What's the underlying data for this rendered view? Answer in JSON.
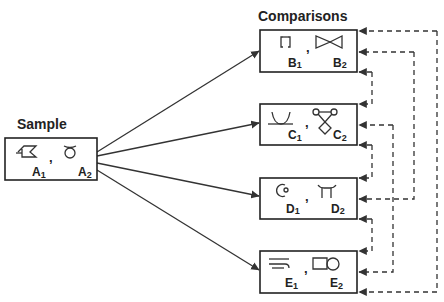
{
  "diagram": {
    "sample": {
      "heading": "Sample",
      "items": [
        {
          "letter": "A",
          "index": "1",
          "glyph": "flag-stroke-icon"
        },
        {
          "letter": "A",
          "index": "2",
          "glyph": "ring-loop-icon"
        }
      ],
      "separator": ","
    },
    "comparisons": {
      "heading": "Comparisons",
      "groups": [
        {
          "id": "B",
          "items": [
            {
              "letter": "B",
              "index": "1",
              "glyph": "brackets-icon"
            },
            {
              "letter": "B",
              "index": "2",
              "glyph": "bowtie-icon"
            }
          ],
          "separator": ","
        },
        {
          "id": "C",
          "items": [
            {
              "letter": "C",
              "index": "1",
              "glyph": "cup-curve-icon"
            },
            {
              "letter": "C",
              "index": "2",
              "glyph": "twin-circle-diamond-icon"
            }
          ],
          "separator": ","
        },
        {
          "id": "D",
          "items": [
            {
              "letter": "D",
              "index": "1",
              "glyph": "open-circle-icon"
            },
            {
              "letter": "D",
              "index": "2",
              "glyph": "pi-arch-icon"
            }
          ],
          "separator": ","
        },
        {
          "id": "E",
          "items": [
            {
              "letter": "E",
              "index": "1",
              "glyph": "parallel-lines-icon"
            },
            {
              "letter": "E",
              "index": "2",
              "glyph": "rect-circle-icon"
            }
          ],
          "separator": ","
        }
      ]
    },
    "solid_arrows": [
      {
        "from": "A",
        "to": "B"
      },
      {
        "from": "A",
        "to": "C"
      },
      {
        "from": "A",
        "to": "D"
      },
      {
        "from": "A",
        "to": "E"
      }
    ],
    "dashed_connections": [
      {
        "from": "B",
        "to": "E"
      },
      {
        "from": "B",
        "to": "D"
      },
      {
        "from": "B",
        "to": "C"
      },
      {
        "from": "C",
        "to": "E"
      },
      {
        "from": "C",
        "to": "D"
      },
      {
        "from": "D",
        "to": "E"
      }
    ]
  }
}
